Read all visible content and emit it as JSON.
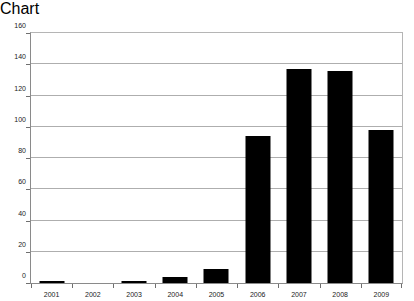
{
  "chart_data": {
    "type": "bar",
    "title": "",
    "subtitle": "",
    "xlabel": "",
    "ylabel": "",
    "categories": [
      "2001",
      "2002",
      "2003",
      "2004",
      "2005",
      "2006",
      "2007",
      "2008",
      "2009"
    ],
    "values": [
      1,
      0,
      1,
      4,
      9,
      94,
      137,
      136,
      98
    ],
    "series": [
      {
        "name": "",
        "values": [
          1,
          0,
          1,
          4,
          9,
          94,
          137,
          136,
          98
        ],
        "color": "#000000"
      }
    ],
    "ylim": [
      0,
      160
    ],
    "ytick_values": [
      0,
      20,
      40,
      60,
      80,
      100,
      120,
      140,
      160
    ],
    "ytick_labels": [
      "0",
      "20",
      "40",
      "60",
      "80",
      "100",
      "120",
      "140",
      "160"
    ],
    "xtick_labels": [
      "2001",
      "2002",
      "2003",
      "2004",
      "2005",
      "2006",
      "2007",
      "2008",
      "2009"
    ],
    "grid": "horizontal",
    "legend": "none",
    "bar_color": "#000000",
    "gridline_color": "#aeaeae",
    "axis_color": "#8a8a8a",
    "background_color": "#ffffff"
  }
}
